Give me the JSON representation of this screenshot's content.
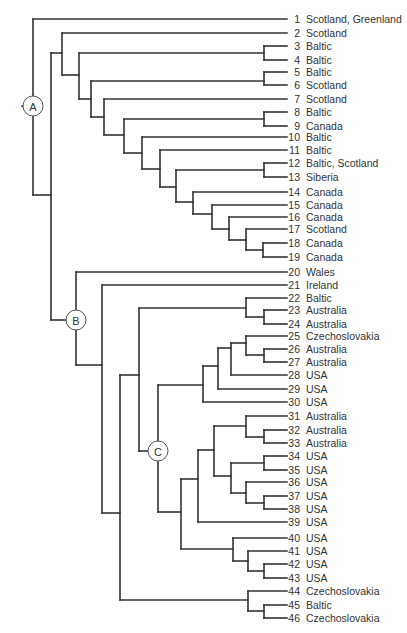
{
  "diagram": {
    "type": "phylogenetic-tree",
    "leaf_line_end_x": 287,
    "num_right_x": 300,
    "name_left_x": 306,
    "leaves": [
      {
        "id": 1,
        "label": "Scotland, Greenland",
        "y": 19
      },
      {
        "id": 2,
        "label": "Scotland",
        "y": 33
      },
      {
        "id": 3,
        "label": "Baltic",
        "y": 46
      },
      {
        "id": 4,
        "label": "Baltic",
        "y": 60
      },
      {
        "id": 5,
        "label": "Baltic",
        "y": 72
      },
      {
        "id": 6,
        "label": "Scotland",
        "y": 85
      },
      {
        "id": 7,
        "label": "Scotland",
        "y": 99
      },
      {
        "id": 8,
        "label": "Baltic",
        "y": 112
      },
      {
        "id": 9,
        "label": "Canada",
        "y": 126
      },
      {
        "id": 10,
        "label": "Baltic",
        "y": 137
      },
      {
        "id": 11,
        "label": "Baltic",
        "y": 150
      },
      {
        "id": 12,
        "label": "Baltic, Scotland",
        "y": 163
      },
      {
        "id": 13,
        "label": "Siberia",
        "y": 177
      },
      {
        "id": 14,
        "label": "Canada",
        "y": 192
      },
      {
        "id": 15,
        "label": "Canada",
        "y": 205
      },
      {
        "id": 16,
        "label": "Canada",
        "y": 217
      },
      {
        "id": 17,
        "label": "Scotland",
        "y": 229
      },
      {
        "id": 18,
        "label": "Canada",
        "y": 243
      },
      {
        "id": 19,
        "label": "Canada",
        "y": 257
      },
      {
        "id": 20,
        "label": "Wales",
        "y": 272
      },
      {
        "id": 21,
        "label": "Ireland",
        "y": 285
      },
      {
        "id": 22,
        "label": "Baltic",
        "y": 298
      },
      {
        "id": 23,
        "label": "Australia",
        "y": 310
      },
      {
        "id": 24,
        "label": "Australia",
        "y": 324
      },
      {
        "id": 25,
        "label": "Czechoslovakia",
        "y": 336
      },
      {
        "id": 26,
        "label": "Australia",
        "y": 349
      },
      {
        "id": 27,
        "label": "Australia",
        "y": 362
      },
      {
        "id": 28,
        "label": "USA",
        "y": 375
      },
      {
        "id": 29,
        "label": "USA",
        "y": 389
      },
      {
        "id": 30,
        "label": "USA",
        "y": 402
      },
      {
        "id": 31,
        "label": "Australia",
        "y": 416
      },
      {
        "id": 32,
        "label": "Australia",
        "y": 430
      },
      {
        "id": 33,
        "label": "Australia",
        "y": 443
      },
      {
        "id": 34,
        "label": "USA",
        "y": 456
      },
      {
        "id": 35,
        "label": "USA",
        "y": 470
      },
      {
        "id": 36,
        "label": "USA",
        "y": 482
      },
      {
        "id": 37,
        "label": "USA",
        "y": 496
      },
      {
        "id": 38,
        "label": "USA",
        "y": 509
      },
      {
        "id": 39,
        "label": "USA",
        "y": 522
      },
      {
        "id": 40,
        "label": "USA",
        "y": 538
      },
      {
        "id": 41,
        "label": "USA",
        "y": 551
      },
      {
        "id": 42,
        "label": "USA",
        "y": 564
      },
      {
        "id": 43,
        "label": "USA",
        "y": 578
      },
      {
        "id": 44,
        "label": "Czechoslovakia",
        "y": 591
      },
      {
        "id": 45,
        "label": "Baltic",
        "y": 605
      },
      {
        "id": 46,
        "label": "Czechoslovakia",
        "y": 618
      }
    ],
    "labeled_nodes": [
      {
        "label": "A",
        "cx": 33,
        "cy": 106,
        "r": 10
      },
      {
        "label": "B",
        "cx": 76,
        "cy": 320,
        "r": 10
      },
      {
        "label": "C",
        "cx": 158,
        "cy": 451,
        "r": 10
      }
    ],
    "segments": [
      [
        22,
        106,
        24,
        106
      ],
      [
        33,
        19,
        33,
        96
      ],
      [
        33,
        116,
        33,
        195
      ],
      [
        33,
        19,
        287,
        19
      ],
      [
        33,
        195,
        51,
        195
      ],
      [
        51,
        53,
        51,
        320
      ],
      [
        51,
        53,
        62,
        53
      ],
      [
        51,
        320,
        66,
        320
      ],
      [
        62,
        33,
        62,
        75
      ],
      [
        62,
        33,
        287,
        33
      ],
      [
        62,
        75,
        79,
        75
      ],
      [
        79,
        53,
        79,
        99
      ],
      [
        79,
        53,
        264,
        53
      ],
      [
        79,
        99,
        91,
        99
      ],
      [
        264,
        46,
        264,
        60
      ],
      [
        264,
        46,
        287,
        46
      ],
      [
        264,
        60,
        287,
        60
      ],
      [
        91,
        81,
        91,
        117
      ],
      [
        91,
        81,
        264,
        81
      ],
      [
        91,
        117,
        104,
        117
      ],
      [
        264,
        72,
        264,
        85
      ],
      [
        264,
        72,
        287,
        72
      ],
      [
        264,
        85,
        287,
        85
      ],
      [
        104,
        99,
        104,
        135
      ],
      [
        104,
        99,
        287,
        99
      ],
      [
        104,
        135,
        124,
        135
      ],
      [
        124,
        119,
        124,
        153
      ],
      [
        124,
        119,
        264,
        119
      ],
      [
        124,
        153,
        142,
        153
      ],
      [
        264,
        112,
        264,
        126
      ],
      [
        264,
        112,
        287,
        112
      ],
      [
        264,
        126,
        287,
        126
      ],
      [
        142,
        137,
        142,
        169
      ],
      [
        142,
        137,
        287,
        137
      ],
      [
        142,
        169,
        160,
        169
      ],
      [
        160,
        150,
        160,
        187
      ],
      [
        160,
        150,
        287,
        150
      ],
      [
        160,
        187,
        176,
        187
      ],
      [
        176,
        170,
        176,
        202
      ],
      [
        176,
        170,
        264,
        170
      ],
      [
        176,
        202,
        193,
        202
      ],
      [
        264,
        163,
        264,
        177
      ],
      [
        264,
        163,
        287,
        163
      ],
      [
        264,
        177,
        287,
        177
      ],
      [
        193,
        192,
        193,
        214
      ],
      [
        193,
        192,
        287,
        192
      ],
      [
        193,
        214,
        212,
        214
      ],
      [
        212,
        205,
        212,
        229
      ],
      [
        212,
        205,
        287,
        205
      ],
      [
        212,
        229,
        229,
        229
      ],
      [
        229,
        217,
        229,
        240
      ],
      [
        229,
        217,
        287,
        217
      ],
      [
        229,
        240,
        246,
        240
      ],
      [
        246,
        229,
        246,
        250
      ],
      [
        246,
        229,
        287,
        229
      ],
      [
        246,
        250,
        263,
        250
      ],
      [
        263,
        243,
        263,
        257
      ],
      [
        263,
        243,
        287,
        243
      ],
      [
        263,
        257,
        287,
        257
      ],
      [
        76,
        272,
        76,
        310
      ],
      [
        76,
        330,
        76,
        365
      ],
      [
        76,
        272,
        287,
        272
      ],
      [
        76,
        365,
        102,
        365
      ],
      [
        102,
        285,
        102,
        513
      ],
      [
        102,
        285,
        287,
        285
      ],
      [
        102,
        513,
        120,
        513
      ],
      [
        120,
        375,
        120,
        600
      ],
      [
        120,
        375,
        139,
        375
      ],
      [
        120,
        600,
        248,
        600
      ],
      [
        139,
        308,
        139,
        451
      ],
      [
        139,
        308,
        246,
        308
      ],
      [
        139,
        451,
        148,
        451
      ],
      [
        246,
        298,
        246,
        317
      ],
      [
        246,
        298,
        287,
        298
      ],
      [
        246,
        317,
        264,
        317
      ],
      [
        264,
        310,
        264,
        324
      ],
      [
        264,
        310,
        287,
        310
      ],
      [
        264,
        324,
        287,
        324
      ],
      [
        158,
        385,
        158,
        441
      ],
      [
        158,
        461,
        158,
        512
      ],
      [
        158,
        385,
        203,
        385
      ],
      [
        158,
        512,
        181,
        512
      ],
      [
        203,
        366,
        203,
        402
      ],
      [
        203,
        366,
        218,
        366
      ],
      [
        203,
        402,
        287,
        402
      ],
      [
        218,
        348,
        218,
        389
      ],
      [
        218,
        348,
        231,
        348
      ],
      [
        218,
        389,
        287,
        389
      ],
      [
        231,
        343,
        231,
        375
      ],
      [
        231,
        343,
        246,
        343
      ],
      [
        231,
        375,
        287,
        375
      ],
      [
        246,
        336,
        246,
        355
      ],
      [
        246,
        336,
        287,
        336
      ],
      [
        246,
        355,
        264,
        355
      ],
      [
        264,
        349,
        264,
        362
      ],
      [
        264,
        349,
        287,
        349
      ],
      [
        264,
        362,
        287,
        362
      ],
      [
        181,
        479,
        181,
        549
      ],
      [
        181,
        479,
        198,
        479
      ],
      [
        181,
        549,
        233,
        549
      ],
      [
        198,
        450,
        198,
        522
      ],
      [
        198,
        450,
        214,
        450
      ],
      [
        198,
        522,
        287,
        522
      ],
      [
        214,
        426,
        214,
        476
      ],
      [
        214,
        426,
        246,
        426
      ],
      [
        214,
        476,
        231,
        476
      ],
      [
        246,
        416,
        246,
        437
      ],
      [
        246,
        416,
        287,
        416
      ],
      [
        246,
        437,
        264,
        437
      ],
      [
        264,
        430,
        264,
        443
      ],
      [
        264,
        430,
        287,
        430
      ],
      [
        264,
        443,
        287,
        443
      ],
      [
        231,
        463,
        231,
        493
      ],
      [
        231,
        463,
        264,
        463
      ],
      [
        231,
        493,
        246,
        493
      ],
      [
        264,
        456,
        264,
        470
      ],
      [
        264,
        456,
        287,
        456
      ],
      [
        264,
        470,
        287,
        470
      ],
      [
        246,
        482,
        246,
        503
      ],
      [
        246,
        482,
        287,
        482
      ],
      [
        246,
        503,
        264,
        503
      ],
      [
        264,
        496,
        264,
        509
      ],
      [
        264,
        496,
        287,
        496
      ],
      [
        264,
        509,
        287,
        509
      ],
      [
        233,
        538,
        233,
        561
      ],
      [
        233,
        538,
        287,
        538
      ],
      [
        233,
        561,
        248,
        561
      ],
      [
        248,
        551,
        248,
        571
      ],
      [
        248,
        551,
        287,
        551
      ],
      [
        248,
        571,
        264,
        571
      ],
      [
        264,
        564,
        264,
        578
      ],
      [
        264,
        564,
        287,
        564
      ],
      [
        264,
        578,
        287,
        578
      ],
      [
        248,
        591,
        248,
        611
      ],
      [
        248,
        591,
        287,
        591
      ],
      [
        248,
        611,
        264,
        611
      ],
      [
        264,
        605,
        264,
        618
      ],
      [
        264,
        605,
        287,
        605
      ],
      [
        264,
        618,
        287,
        618
      ]
    ]
  }
}
